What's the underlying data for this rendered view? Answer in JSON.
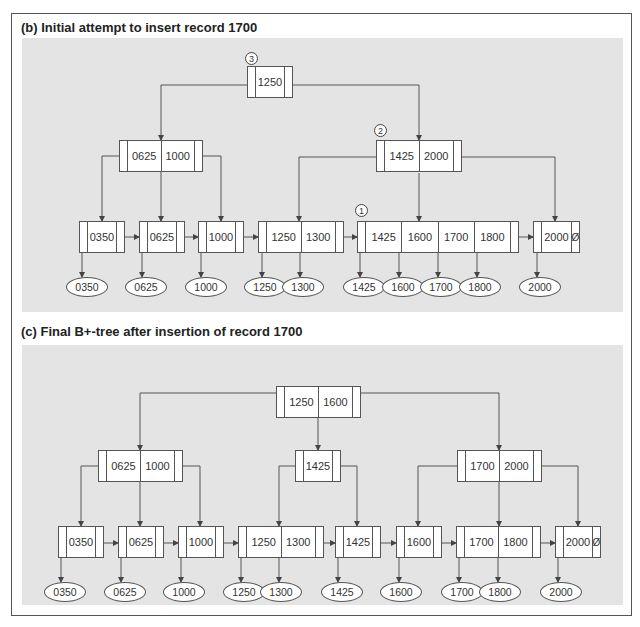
{
  "panel_b": {
    "title": "(b) Initial attempt to insert record 1700",
    "steps": [
      {
        "label": "3",
        "x": 245,
        "y": 52
      },
      {
        "label": "2",
        "x": 374,
        "y": 124
      },
      {
        "label": "1",
        "x": 355,
        "y": 204
      }
    ],
    "nodes": [
      {
        "keys": [
          "1250"
        ],
        "x": 247,
        "y": 66,
        "w": 46
      },
      {
        "keys": [
          "0625",
          "1000"
        ],
        "x": 119,
        "y": 140,
        "w": 84
      },
      {
        "keys": [
          "1425",
          "2000"
        ],
        "x": 376,
        "y": 140,
        "w": 86
      },
      {
        "keys": [
          "0350"
        ],
        "x": 79,
        "y": 221,
        "w": 46
      },
      {
        "keys": [
          "0625"
        ],
        "x": 139,
        "y": 221,
        "w": 46
      },
      {
        "keys": [
          "1000"
        ],
        "x": 198,
        "y": 221,
        "w": 46
      },
      {
        "keys": [
          "1250",
          "1300"
        ],
        "x": 258,
        "y": 221,
        "w": 86
      },
      {
        "keys": [
          "1425",
          "1600",
          "1700",
          "1800"
        ],
        "x": 357,
        "y": 221,
        "w": 162
      },
      {
        "keys": [
          "2000"
        ],
        "x": 533,
        "y": 221,
        "w": 47,
        "null_ptr": "Ø"
      }
    ],
    "records": [
      {
        "label": "0350",
        "x": 66,
        "y": 277
      },
      {
        "label": "0625",
        "x": 125,
        "y": 277
      },
      {
        "label": "1000",
        "x": 185,
        "y": 277
      },
      {
        "label": "1250",
        "x": 244,
        "y": 277
      },
      {
        "label": "1300",
        "x": 282,
        "y": 277
      },
      {
        "label": "1425",
        "x": 343,
        "y": 277
      },
      {
        "label": "1600",
        "x": 382,
        "y": 277
      },
      {
        "label": "1700",
        "x": 420,
        "y": 277
      },
      {
        "label": "1800",
        "x": 459,
        "y": 277
      },
      {
        "label": "2000",
        "x": 519,
        "y": 277
      }
    ]
  },
  "panel_c": {
    "title": "(c) Final B+-tree after insertion of record 1700",
    "nodes": [
      {
        "keys": [
          "1250",
          "1600"
        ],
        "x": 276,
        "y": 386,
        "w": 85
      },
      {
        "keys": [
          "0625",
          "1000"
        ],
        "x": 98,
        "y": 450,
        "w": 85
      },
      {
        "keys": [
          "1425"
        ],
        "x": 295,
        "y": 450,
        "w": 46
      },
      {
        "keys": [
          "1700",
          "2000"
        ],
        "x": 457,
        "y": 450,
        "w": 85
      },
      {
        "keys": [
          "0350"
        ],
        "x": 58,
        "y": 526,
        "w": 46
      },
      {
        "keys": [
          "0625"
        ],
        "x": 118,
        "y": 526,
        "w": 46
      },
      {
        "keys": [
          "1000"
        ],
        "x": 178,
        "y": 526,
        "w": 46
      },
      {
        "keys": [
          "1250",
          "1300"
        ],
        "x": 238,
        "y": 526,
        "w": 86
      },
      {
        "keys": [
          "1425"
        ],
        "x": 335,
        "y": 526,
        "w": 46
      },
      {
        "keys": [
          "1600"
        ],
        "x": 396,
        "y": 526,
        "w": 46
      },
      {
        "keys": [
          "1700",
          "1800"
        ],
        "x": 456,
        "y": 526,
        "w": 85
      },
      {
        "keys": [
          "2000"
        ],
        "x": 555,
        "y": 526,
        "w": 46,
        "null_ptr": "Ø"
      }
    ],
    "records": [
      {
        "label": "0350",
        "x": 44,
        "y": 582
      },
      {
        "label": "0625",
        "x": 104,
        "y": 582
      },
      {
        "label": "1000",
        "x": 163,
        "y": 582
      },
      {
        "label": "1250",
        "x": 223,
        "y": 582
      },
      {
        "label": "1300",
        "x": 260,
        "y": 582
      },
      {
        "label": "1425",
        "x": 321,
        "y": 582
      },
      {
        "label": "1600",
        "x": 380,
        "y": 582
      },
      {
        "label": "1700",
        "x": 441,
        "y": 582
      },
      {
        "label": "1800",
        "x": 479,
        "y": 582
      },
      {
        "label": "2000",
        "x": 540,
        "y": 582
      }
    ]
  }
}
